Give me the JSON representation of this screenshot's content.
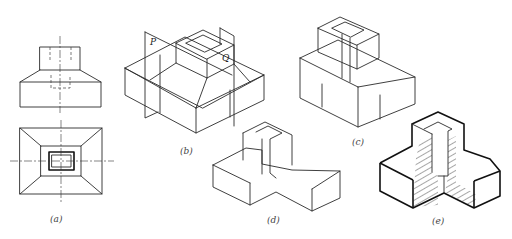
{
  "figure": {
    "panels": [
      {
        "id": "a",
        "caption": "(a)",
        "type": "orthographic front and top views"
      },
      {
        "id": "b",
        "caption": "(b)",
        "type": "isometric with cutting planes"
      },
      {
        "id": "c",
        "caption": "(c)",
        "type": "isometric cut view"
      },
      {
        "id": "d",
        "caption": "(d)",
        "type": "isometric quarter cut"
      },
      {
        "id": "e",
        "caption": "(e)",
        "type": "isometric sectional view with hatching"
      }
    ],
    "plane_labels": {
      "p": "P",
      "q": "Q"
    },
    "colors": {
      "line": "#2a2a2a",
      "background": "#ffffff",
      "hatch": "#222222"
    }
  }
}
